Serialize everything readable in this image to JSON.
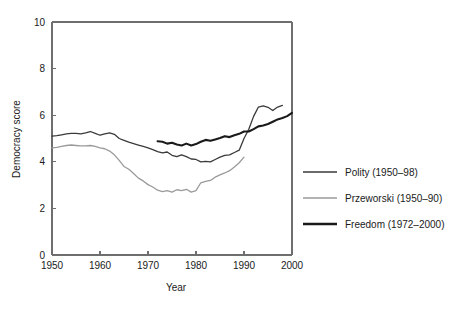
{
  "chart_data": {
    "type": "line",
    "title": "",
    "xlabel": "Year",
    "ylabel": "Democracy score",
    "xlim": [
      1950,
      2000
    ],
    "ylim": [
      0,
      10
    ],
    "xticks": [
      1950,
      1960,
      1970,
      1980,
      1990,
      2000
    ],
    "xtick_labels": [
      "1950",
      "1960",
      "1970",
      "1980",
      "1990",
      "2000"
    ],
    "yticks": [
      0,
      2,
      4,
      6,
      8,
      10
    ],
    "ytick_labels": [
      "0",
      "2",
      "4",
      "6",
      "8",
      "10"
    ],
    "grid": false,
    "legend_position": "right",
    "series": [
      {
        "name": "Polity (1950–98)",
        "color": "#3a3a3a",
        "width": 1.3,
        "x": [
          1950,
          1951,
          1952,
          1953,
          1954,
          1955,
          1956,
          1957,
          1958,
          1959,
          1960,
          1961,
          1962,
          1963,
          1964,
          1965,
          1966,
          1967,
          1968,
          1969,
          1970,
          1971,
          1972,
          1973,
          1974,
          1975,
          1976,
          1977,
          1978,
          1979,
          1980,
          1981,
          1982,
          1983,
          1984,
          1985,
          1986,
          1987,
          1988,
          1989,
          1990,
          1991,
          1992,
          1993,
          1994,
          1995,
          1996,
          1997,
          1998
        ],
        "y": [
          5.1,
          5.12,
          5.16,
          5.2,
          5.22,
          5.22,
          5.2,
          5.24,
          5.3,
          5.22,
          5.14,
          5.2,
          5.24,
          5.18,
          5.0,
          4.92,
          4.84,
          4.78,
          4.72,
          4.66,
          4.6,
          4.52,
          4.44,
          4.38,
          4.42,
          4.28,
          4.22,
          4.3,
          4.22,
          4.12,
          4.1,
          4.0,
          4.02,
          4.0,
          4.1,
          4.2,
          4.28,
          4.3,
          4.4,
          4.5,
          5.0,
          5.4,
          5.95,
          6.35,
          6.4,
          6.34,
          6.2,
          6.35,
          6.42
        ]
      },
      {
        "name": "Przeworski (1950–90)",
        "color": "#9a9a9a",
        "width": 1.3,
        "x": [
          1950,
          1951,
          1952,
          1953,
          1954,
          1955,
          1956,
          1957,
          1958,
          1959,
          1960,
          1961,
          1962,
          1963,
          1964,
          1965,
          1966,
          1967,
          1968,
          1969,
          1970,
          1971,
          1972,
          1973,
          1974,
          1975,
          1976,
          1977,
          1978,
          1979,
          1980,
          1981,
          1982,
          1983,
          1984,
          1985,
          1986,
          1987,
          1988,
          1989,
          1990
        ],
        "y": [
          4.6,
          4.62,
          4.66,
          4.7,
          4.72,
          4.7,
          4.68,
          4.68,
          4.7,
          4.66,
          4.6,
          4.56,
          4.46,
          4.3,
          4.06,
          3.8,
          3.68,
          3.5,
          3.3,
          3.18,
          3.02,
          2.92,
          2.78,
          2.72,
          2.76,
          2.7,
          2.8,
          2.76,
          2.82,
          2.7,
          2.76,
          3.1,
          3.16,
          3.2,
          3.34,
          3.44,
          3.52,
          3.62,
          3.78,
          3.96,
          4.2
        ]
      },
      {
        "name": "Freedom (1972–2000)",
        "color": "#1a1a1a",
        "width": 2.1,
        "x": [
          1972,
          1973,
          1974,
          1975,
          1976,
          1977,
          1978,
          1979,
          1980,
          1981,
          1982,
          1983,
          1984,
          1985,
          1986,
          1987,
          1988,
          1989,
          1990,
          1991,
          1992,
          1993,
          1994,
          1995,
          1996,
          1997,
          1998,
          1999,
          2000
        ],
        "y": [
          4.88,
          4.86,
          4.78,
          4.82,
          4.74,
          4.7,
          4.78,
          4.7,
          4.76,
          4.86,
          4.94,
          4.9,
          4.96,
          5.02,
          5.1,
          5.06,
          5.14,
          5.2,
          5.3,
          5.3,
          5.4,
          5.52,
          5.56,
          5.62,
          5.72,
          5.82,
          5.88,
          5.96,
          6.1
        ]
      }
    ],
    "legend_entries": [
      {
        "label": "Polity (1950–98)",
        "color": "#3a3a3a",
        "width": 1.5
      },
      {
        "label": "Przeworski (1950–90)",
        "color": "#9a9a9a",
        "width": 1.3
      },
      {
        "label": "Freedom (1972–2000)",
        "color": "#1a1a1a",
        "width": 2.3
      }
    ]
  },
  "axis": {
    "ylabel": "Democracy score",
    "xlabel": "Year"
  },
  "colors": {
    "frame": "#6e6e6e",
    "polity": "#3a3a3a",
    "przeworski": "#9a9a9a",
    "freedom": "#1a1a1a",
    "text": "#1a1a1a",
    "background": "#ffffff"
  }
}
